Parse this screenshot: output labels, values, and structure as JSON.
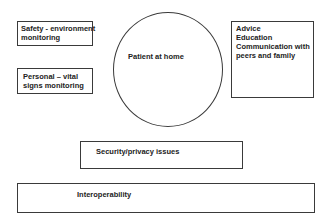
{
  "diagram": {
    "center": {
      "label": "Patient at home"
    },
    "left_boxes": [
      {
        "lines": [
          "Safety - environment",
          "monitoring"
        ]
      },
      {
        "lines": [
          "Personal – vital",
          "signs monitoring"
        ]
      }
    ],
    "right_box": {
      "lines": [
        "Advice",
        "Education",
        "Communication with",
        "peers and family"
      ]
    },
    "bottom_boxes": [
      {
        "label": "Security/privacy issues"
      },
      {
        "label": "Interoperability"
      }
    ]
  }
}
